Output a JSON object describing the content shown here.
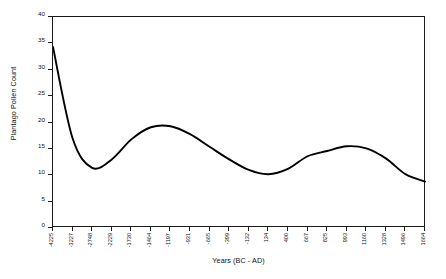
{
  "chart_data": {
    "type": "line",
    "title": "",
    "xlabel": "Years (BC - AD)",
    "ylabel": "Plantago Pollen Count",
    "ylim": [
      0,
      40
    ],
    "ytick_labels": [
      "0",
      "5",
      "10",
      "15",
      "20",
      "25",
      "30",
      "35",
      "40"
    ],
    "ytick_values": [
      0,
      5,
      10,
      15,
      20,
      25,
      30,
      35,
      40
    ],
    "grid": false,
    "legend": "none",
    "line_color": "#000000",
    "categories": [
      "-4225",
      "-3227",
      "-2748",
      "-2229",
      "-1730",
      "-1464",
      "-1197",
      "-931",
      "-665",
      "-399",
      "-132",
      "134",
      "400",
      "667",
      "825",
      "993",
      "1160",
      "1328",
      "1496",
      "1664"
    ],
    "series": [
      {
        "name": "Plantago Pollen Count",
        "values": [
          34.3,
          17.0,
          11.4,
          13.0,
          16.8,
          19.1,
          19.3,
          17.8,
          15.4,
          13.0,
          11.0,
          10.2,
          11.2,
          13.6,
          14.6,
          15.5,
          15.1,
          13.2,
          10.2,
          8.8
        ]
      }
    ],
    "annotations": []
  },
  "axes": {
    "y_title": "Plantago Pollen Count",
    "x_title": "Years (BC - AD)"
  }
}
